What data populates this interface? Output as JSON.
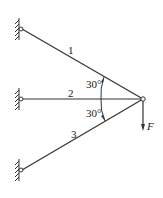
{
  "diagram": {
    "type": "truss-three-bars",
    "colors": {
      "line": "#333333",
      "background": "#ffffff"
    },
    "supports": [
      {
        "id": "top",
        "x": 21,
        "y": 29
      },
      {
        "id": "middle",
        "x": 21,
        "y": 99
      },
      {
        "id": "bottom",
        "x": 21,
        "y": 170
      }
    ],
    "joint": {
      "x": 143,
      "y": 99
    },
    "bars": [
      {
        "label": "1"
      },
      {
        "label": "2"
      },
      {
        "label": "3"
      }
    ],
    "angles": [
      {
        "label": "30°"
      },
      {
        "label": "30°"
      }
    ],
    "force": {
      "label": "F"
    }
  }
}
